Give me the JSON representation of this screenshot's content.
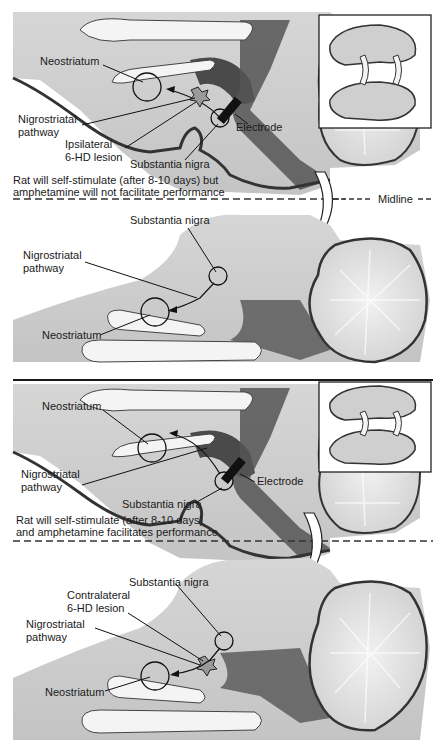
{
  "figure": {
    "top_panel": {
      "upper_brain": {
        "labels": {
          "neostriatum": "Neostriatum",
          "nigrostriatal_pathway": [
            "Nigrostriatal",
            "pathway"
          ],
          "lesion": [
            "Ipsilateral",
            "6-HD lesion"
          ],
          "substantia_nigra": "Substantia nigra",
          "electrode": "Electrode"
        }
      },
      "caption": [
        "Rat will self-stimulate (after 8-10 days) but",
        "amphetamine will not facilitate performance"
      ],
      "midline_label": "Midline",
      "lower_brain": {
        "labels": {
          "substantia_nigra": "Substantia nigra",
          "nigrostriatal_pathway": [
            "Nigrostriatal",
            "pathway"
          ],
          "neostriatum": "Neostriatum"
        }
      }
    },
    "bottom_panel": {
      "upper_brain": {
        "labels": {
          "neostriatum": "Neostriatum",
          "nigrostriatal_pathway": [
            "Nigrostriatal",
            "pathway"
          ],
          "substantia_nigra": "Substantia nigra",
          "electrode": "Electrode"
        }
      },
      "caption": [
        "Rat will self-stimulate (after 8-10 days)",
        "and amphetamine facilitates performance"
      ],
      "lower_brain": {
        "labels": {
          "substantia_nigra": "Substantia nigra",
          "lesion": [
            "Contralateral",
            "6-HD lesion"
          ],
          "nigrostriatal_pathway": [
            "Nigrostriatal",
            "pathway"
          ],
          "neostriatum": "Neostriatum"
        }
      }
    }
  }
}
